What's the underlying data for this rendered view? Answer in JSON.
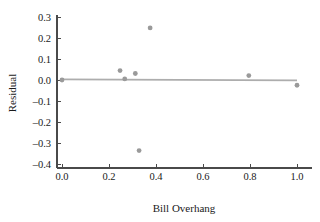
{
  "chart_data": {
    "type": "scatter",
    "title": "",
    "xlabel": "Bill Overhang",
    "ylabel": "Residual",
    "xlim": [
      -0.05,
      1.06
    ],
    "ylim": [
      -0.41,
      0.31
    ],
    "xticks": [
      0.0,
      0.2,
      0.4,
      0.6,
      0.8,
      1.0
    ],
    "xticklabels": [
      "0.0",
      "0.2",
      "0.4",
      "0.6",
      "0.8",
      "1.0"
    ],
    "yticks": [
      0.3,
      0.2,
      0.1,
      0.0,
      -0.1,
      -0.2,
      -0.3,
      -0.4
    ],
    "yticklabels": [
      "0.3",
      "0.2",
      "0.1",
      "0.0",
      "–0.1",
      "–0.2",
      "–0.3",
      "–0.4"
    ],
    "grid": false,
    "legend": false,
    "point_color": "#9a9a9a",
    "line_color": "#adadad",
    "axis_color": "#4a4a4a",
    "marker_size": 2.4,
    "points": [
      {
        "x": 0.0,
        "y": 0.0
      },
      {
        "x": 0.247,
        "y": 0.045
      },
      {
        "x": 0.267,
        "y": 0.005
      },
      {
        "x": 0.312,
        "y": 0.031
      },
      {
        "x": 0.375,
        "y": 0.248
      },
      {
        "x": 0.328,
        "y": -0.336
      },
      {
        "x": 0.795,
        "y": 0.021
      },
      {
        "x": 1.0,
        "y": -0.025
      }
    ],
    "series": [
      {
        "name": "Residuals",
        "x": [
          0.0,
          0.247,
          0.267,
          0.312,
          0.375,
          0.328,
          0.795,
          1.0
        ],
        "values": [
          0.0,
          0.045,
          0.005,
          0.031,
          0.248,
          -0.336,
          0.021,
          -0.025
        ]
      }
    ],
    "reference_line": {
      "name": "zero-fit-line",
      "x_start": 0.0,
      "y_start": 0.003,
      "x_end": 1.0,
      "y_end": -0.002
    }
  },
  "axes": {
    "x_title": "Bill Overhang",
    "y_title": "Residual"
  }
}
